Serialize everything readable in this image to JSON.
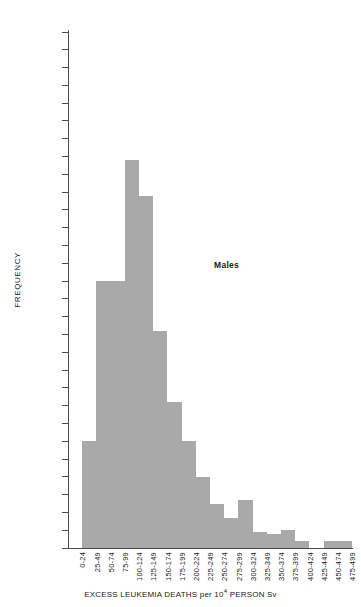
{
  "chart_data": {
    "type": "bar",
    "title": "",
    "subtitle": "",
    "xlabel_parts": {
      "before": "EXCESS LEUKEMIA DEATHS per 10",
      "exponent": "4",
      "after": " PERSON Sv"
    },
    "xlabel": "EXCESS LEUKEMIA DEATHS per 10^4 PERSON Sv",
    "ylabel": "FREQUENCY",
    "ylim": [
      0,
      290
    ],
    "ytick_step": 10,
    "yticks": [
      0,
      10,
      20,
      30,
      40,
      50,
      60,
      70,
      80,
      90,
      100,
      110,
      120,
      130,
      140,
      150,
      160,
      170,
      180,
      190,
      200,
      210,
      220,
      230,
      240,
      250,
      260,
      270,
      280,
      290
    ],
    "grid": false,
    "legend": "none",
    "annotations": [
      {
        "text": "Males",
        "x_category": "175-199",
        "y_value": 150
      }
    ],
    "bar_color": "#a9a9a9",
    "axis_color": "#4d4d4d",
    "categories": [
      "0-24",
      "25-49",
      "50-74",
      "75-99",
      "100-124",
      "125-149",
      "150-174",
      "175-199",
      "200-224",
      "225-249",
      "250-274",
      "275-299",
      "300-324",
      "325-349",
      "350-374",
      "375-399",
      "400-424",
      "425-449",
      "450-474",
      "475-499"
    ],
    "values": [
      0,
      60,
      150,
      150,
      218,
      198,
      122,
      82,
      60,
      40,
      25,
      17,
      27,
      9,
      8,
      10,
      4,
      0,
      4,
      4
    ]
  },
  "chart_labels": {
    "y_axis_title": "FREQUENCY",
    "series_annotation": "Males"
  }
}
